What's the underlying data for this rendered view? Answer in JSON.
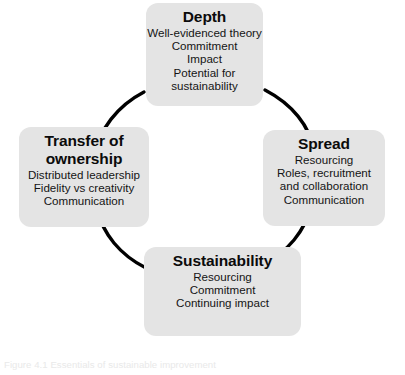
{
  "figure": {
    "caption": "Figure 4.1 Essentials of sustainable improvement",
    "background_color": "#ffffff",
    "node_fill_color": "#e4e4e4",
    "arc_color": "#000000",
    "text_color": "#111111"
  },
  "nodes": {
    "depth": {
      "title": "Depth",
      "lines": [
        "Well-evidenced theory",
        "Commitment",
        "Impact",
        "Potential for",
        "sustainability"
      ]
    },
    "spread": {
      "title": "Spread",
      "lines": [
        "Resourcing",
        "Roles, recruitment",
        "and collaboration",
        "Communication"
      ]
    },
    "sustainability": {
      "title": "Sustainability",
      "lines": [
        "Resourcing",
        "Commitment",
        "Continuing impact"
      ]
    },
    "transfer": {
      "title_line_1": "Transfer of",
      "title_line_2": "ownership",
      "lines": [
        "Distributed leadership",
        "Fidelity vs creativity",
        "Communication"
      ]
    }
  },
  "arcs": [
    {
      "name": "transfer-to-depth",
      "from": "transfer",
      "to": "depth"
    },
    {
      "name": "depth-to-spread",
      "from": "depth",
      "to": "spread"
    },
    {
      "name": "spread-to-sustainability",
      "from": "spread",
      "to": "sustainability"
    },
    {
      "name": "sustainability-to-transfer",
      "from": "sustainability",
      "to": "transfer"
    }
  ]
}
